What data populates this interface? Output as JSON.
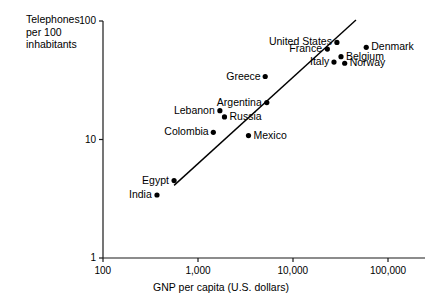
{
  "chart_data": {
    "type": "scatter",
    "title": "",
    "xlabel": "GNP per capita (U.S. dollars)",
    "ylabel": "Telephones\nper 100\ninhabitants",
    "xscale": "log",
    "yscale": "log",
    "xlim": [
      100,
      200000
    ],
    "ylim": [
      1,
      100
    ],
    "xticks": [
      "100",
      "1,000",
      "10,000",
      "100,000"
    ],
    "xtick_values": [
      100,
      1000,
      10000,
      100000
    ],
    "yticks": [
      "1",
      "10",
      "100"
    ],
    "ytick_values": [
      1,
      10,
      100
    ],
    "grid": false,
    "legend": false,
    "annotations": [
      "fitted straight trend line through points on log-log axes"
    ],
    "trendline": {
      "x_start": 560,
      "y_start": 4.1,
      "x_end": 46000,
      "y_end": 102
    },
    "points": [
      {
        "label": "India",
        "x": 370,
        "y": 3.4,
        "label_side": "left"
      },
      {
        "label": "Egypt",
        "x": 560,
        "y": 4.5,
        "label_side": "left"
      },
      {
        "label": "Colombia",
        "x": 1450,
        "y": 11.5,
        "label_side": "left"
      },
      {
        "label": "Mexico",
        "x": 3400,
        "y": 10.8,
        "label_side": "right"
      },
      {
        "label": "Lebanon",
        "x": 1700,
        "y": 17.5,
        "label_side": "left"
      },
      {
        "label": "Russia",
        "x": 1900,
        "y": 15.5,
        "label_side": "right"
      },
      {
        "label": "Argentina",
        "x": 5300,
        "y": 20.5,
        "label_side": "left"
      },
      {
        "label": "Greece",
        "x": 5100,
        "y": 34,
        "label_side": "left"
      },
      {
        "label": "United States",
        "x": 29000,
        "y": 66,
        "label_side": "left"
      },
      {
        "label": "France",
        "x": 23000,
        "y": 58,
        "label_side": "left"
      },
      {
        "label": "Italy",
        "x": 27000,
        "y": 45,
        "label_side": "left"
      },
      {
        "label": "Belgium",
        "x": 32000,
        "y": 50,
        "label_side": "right"
      },
      {
        "label": "Norway",
        "x": 35000,
        "y": 44,
        "label_side": "right"
      },
      {
        "label": "Denmark",
        "x": 59000,
        "y": 60,
        "label_side": "right"
      }
    ],
    "colors": {
      "axis": "#1a1a1a",
      "point": "#000000",
      "line": "#000000",
      "background": "#ffffff"
    }
  }
}
